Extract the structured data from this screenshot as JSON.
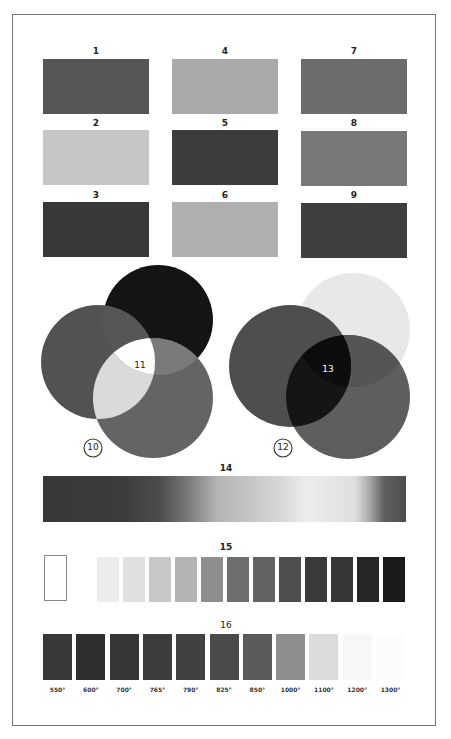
{
  "figure": {
    "swatch_grid": [
      {
        "label": "1",
        "color": "#565656"
      },
      {
        "label": "2",
        "color": "#c6c6c6"
      },
      {
        "label": "3",
        "color": "#383838"
      },
      {
        "label": "4",
        "color": "#aaaaaa"
      },
      {
        "label": "5",
        "color": "#3c3c3c"
      },
      {
        "label": "6",
        "color": "#b0b0b0"
      },
      {
        "label": "7",
        "color": "#6c6c6c"
      },
      {
        "label": "8",
        "color": "#787878"
      },
      {
        "label": "9",
        "color": "#3e3e3e"
      }
    ],
    "additive_diagram": {
      "label": "10",
      "center_label": "11"
    },
    "subtractive_diagram": {
      "label": "12",
      "center_label": "13"
    },
    "gradient_bar": {
      "label": "14"
    },
    "gray_scale": {
      "label": "15",
      "colors": [
        "#ececec",
        "#e0e0e0",
        "#c8c8c8",
        "#b4b4b4",
        "#8e8e8e",
        "#6e6e6e",
        "#626262",
        "#4e4e4e",
        "#3a3a3a",
        "#363636",
        "#262626",
        "#1a1a1a"
      ]
    },
    "temperature_scale": {
      "label": "16",
      "items": [
        {
          "temp": "550°",
          "color": "#383838"
        },
        {
          "temp": "600°",
          "color": "#2e2e2e"
        },
        {
          "temp": "700°",
          "color": "#363636"
        },
        {
          "temp": "765°",
          "color": "#3c3c3c"
        },
        {
          "temp": "790°",
          "color": "#414141"
        },
        {
          "temp": "825°",
          "color": "#4a4a4a"
        },
        {
          "temp": "850°",
          "color": "#5a5a5a"
        },
        {
          "temp": "1000°",
          "color": "#8e8e8e"
        },
        {
          "temp": "1100°",
          "color": "#dcdcdc"
        },
        {
          "temp": "1200°",
          "color": "#f7f7f7"
        },
        {
          "temp": "1300°",
          "color": "#fcfcfc"
        }
      ]
    }
  }
}
